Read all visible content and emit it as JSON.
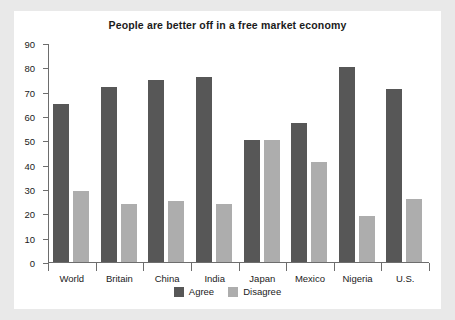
{
  "chart_data": {
    "type": "bar",
    "title": "People are better off in a free market economy",
    "xlabel": "",
    "ylabel": "",
    "ylim": [
      0,
      90
    ],
    "yticks": [
      0,
      10,
      20,
      30,
      40,
      50,
      60,
      70,
      80,
      90
    ],
    "grid": false,
    "legend_position": "bottom",
    "categories": [
      "World",
      "Britain",
      "China",
      "India",
      "Japan",
      "Mexico",
      "Nigeria",
      "U.S."
    ],
    "series": [
      {
        "name": "Agree",
        "color": "#575757",
        "values": [
          65,
          72,
          75,
          76,
          50,
          57,
          80,
          71
        ]
      },
      {
        "name": "Disagree",
        "color": "#adadad",
        "values": [
          29,
          24,
          25,
          24,
          50,
          41,
          19,
          26
        ]
      }
    ]
  },
  "colors": {
    "agree": "#575757",
    "disagree": "#adadad",
    "axis": "#6d6d6d",
    "panel_background": "#ffffff",
    "page_background": "#e9e9e9",
    "text": "#1b1b1b"
  }
}
